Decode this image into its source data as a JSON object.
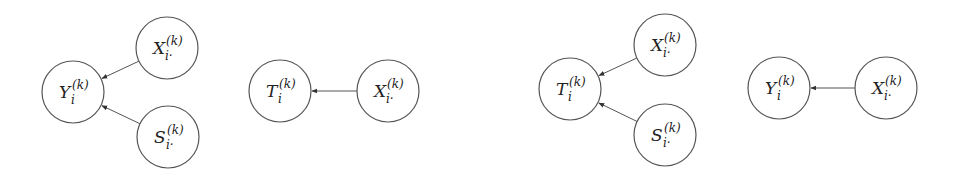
{
  "diagrams": [
    {
      "name": "left-graph-1",
      "nodes": [
        {
          "id": "Y",
          "base": "Y",
          "sub": "i",
          "sup": "(k)"
        },
        {
          "id": "X",
          "base": "X",
          "sub": "i·",
          "sup": "(k)"
        },
        {
          "id": "S",
          "base": "S",
          "sub": "i·",
          "sup": "(k)"
        }
      ],
      "edges": [
        {
          "from": "X",
          "to": "Y"
        },
        {
          "from": "S",
          "to": "Y"
        }
      ]
    },
    {
      "name": "left-graph-2",
      "nodes": [
        {
          "id": "T",
          "base": "T",
          "sub": "i",
          "sup": "(k)"
        },
        {
          "id": "X",
          "base": "X",
          "sub": "i·",
          "sup": "(k)"
        }
      ],
      "edges": [
        {
          "from": "X",
          "to": "T"
        }
      ]
    },
    {
      "name": "right-graph-1",
      "nodes": [
        {
          "id": "T",
          "base": "T",
          "sub": "i",
          "sup": "(k)"
        },
        {
          "id": "X",
          "base": "X",
          "sub": "i·",
          "sup": "(k)"
        },
        {
          "id": "S",
          "base": "S",
          "sub": "i·",
          "sup": "(k)"
        }
      ],
      "edges": [
        {
          "from": "X",
          "to": "T"
        },
        {
          "from": "S",
          "to": "T"
        }
      ]
    },
    {
      "name": "right-graph-2",
      "nodes": [
        {
          "id": "Y",
          "base": "Y",
          "sub": "i",
          "sup": "(k)"
        },
        {
          "id": "X",
          "base": "X",
          "sub": "i·",
          "sup": "(k)"
        }
      ],
      "edges": [
        {
          "from": "X",
          "to": "Y"
        }
      ]
    }
  ]
}
